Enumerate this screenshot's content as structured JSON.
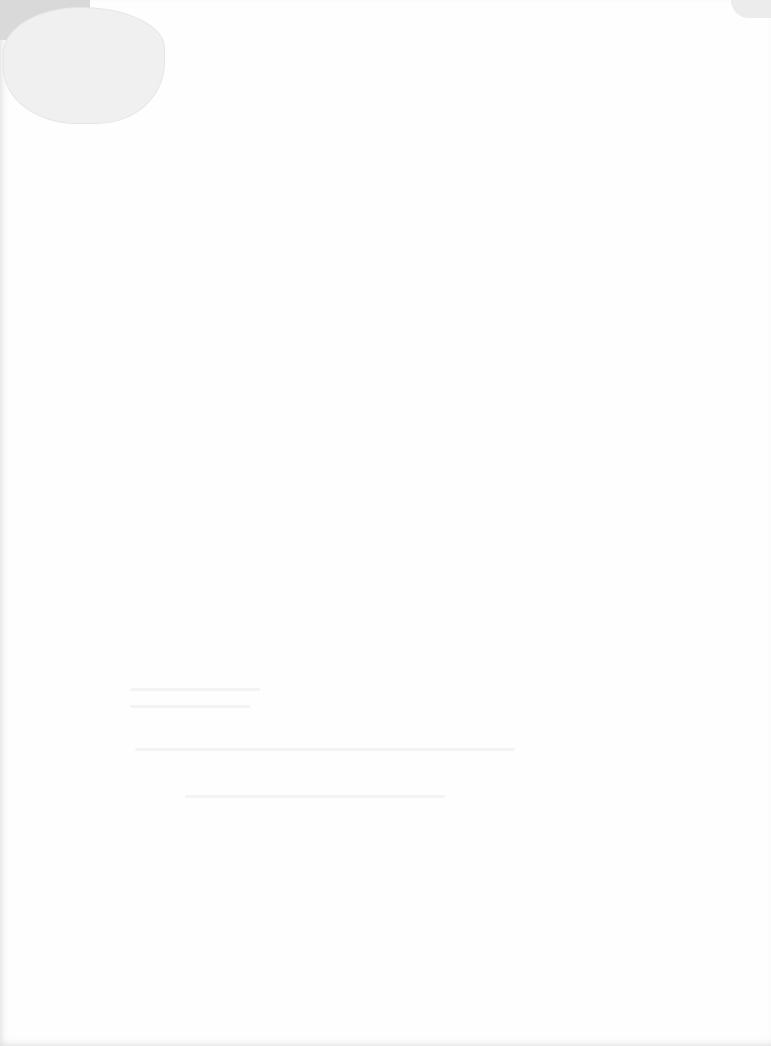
{
  "page": {
    "type": "scanned-document",
    "text_legible": false,
    "background_color": "#fefefe",
    "stain_color": "#f0f0f0"
  }
}
